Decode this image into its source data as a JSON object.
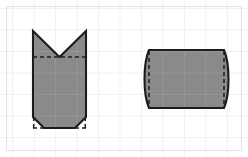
{
  "canvas": {
    "width": 248,
    "height": 157,
    "background_color": "#ffffff",
    "frame_color": "#e4e4e4",
    "frame_inset": 6,
    "label": "geometry worksheet canvas"
  },
  "grid": {
    "visible": true,
    "spacing": 21.5,
    "origin_x": 12.0,
    "origin_y": 8.0,
    "line_color": "#ededed",
    "line_color_over_fill": "#9a9a9a",
    "line_width": 1.4
  },
  "style": {
    "fill_color": "#8a8a8a",
    "stroke_color": "#1c1c1c",
    "stroke_width": 2.1,
    "dash_color": "#1c1c1c",
    "dash_width": 1.5,
    "dash_pattern": "4,3"
  },
  "figures": [
    {
      "id": "left-figure",
      "name": "notched-square-with-chamfered-base",
      "description": "Square with a V notch removed from the top edge and both bottom corners chamfered off",
      "bounds": {
        "x": 33,
        "y": 31,
        "width": 53,
        "height": 86
      },
      "outline_points": "33,31 33,117 44,128 75,128 86,117 86,31 59.5,57 33,31",
      "dashed_segments": [
        {
          "name": "top-notch-chord",
          "x1": 33,
          "y1": 57,
          "x2": 86,
          "y2": 57
        },
        {
          "name": "bottom-left-corner-vertical",
          "x1": 33,
          "y1": 117,
          "x2": 33,
          "y2": 128
        },
        {
          "name": "bottom-right-corner-vertical",
          "x1": 86,
          "y1": 117,
          "x2": 86,
          "y2": 128
        },
        {
          "name": "bottom-base-horizontal",
          "x1": 33,
          "y1": 128,
          "x2": 86,
          "y2": 128
        }
      ]
    },
    {
      "id": "right-figure",
      "name": "translated-curve-rectangle",
      "description": "Rectangle whose left edge is cut by a concave arc and whose right edge is extended by an equal convex arc",
      "bounds": {
        "x": 146,
        "y": 50,
        "width": 86,
        "height": 58
      },
      "outline_path": "M 149,50 L 224,50 C 230,64 230,94 224,108 L 149,108 C 143,94 143,64 149,50 Z",
      "dashed_segments": [
        {
          "name": "left-straight-edge",
          "x1": 149,
          "y1": 50,
          "x2": 149,
          "y2": 108
        },
        {
          "name": "right-straight-edge",
          "x1": 224,
          "y1": 50,
          "x2": 224,
          "y2": 108
        }
      ]
    }
  ]
}
